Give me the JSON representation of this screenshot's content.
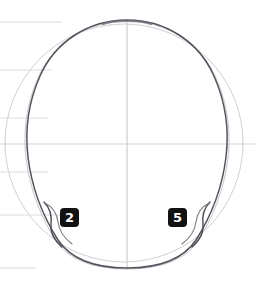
{
  "figure": {
    "background_color": "#ffffff",
    "width": 255,
    "height": 284
  },
  "ink": {
    "contour_color": "#3c3c42",
    "construction_color": "#c9c9cf",
    "guide_color": "#d8d8de",
    "badge_background": "#121212",
    "badge_text_color": "#ffffff"
  },
  "annotations": {
    "badges": [
      {
        "id": "badge-2",
        "label": "2",
        "side": "left",
        "x": 60,
        "y": 208
      },
      {
        "id": "badge-5",
        "label": "5",
        "side": "right",
        "x": 168,
        "y": 208
      }
    ]
  },
  "construction": {
    "circle": {
      "cx": 124,
      "cy": 143,
      "r": 119
    },
    "vertical_axis": {
      "x": 127,
      "y_top": 20,
      "y_bottom": 270
    },
    "horizontal_axis": {
      "y": 144,
      "x_left": 0,
      "x_right": 255
    },
    "guide_lines": [
      {
        "id": "guide-1",
        "y": 22,
        "x_left": 0,
        "x_right": 62
      },
      {
        "id": "guide-2",
        "y": 70,
        "x_left": 0,
        "x_right": 52
      },
      {
        "id": "guide-3",
        "y": 118,
        "x_left": 0,
        "x_right": 48
      },
      {
        "id": "guide-4",
        "y": 172,
        "x_left": 0,
        "x_right": 48
      },
      {
        "id": "guide-5",
        "y": 215,
        "x_left": 0,
        "x_right": 60
      },
      {
        "id": "guide-6",
        "y": 268,
        "x_left": 0,
        "x_right": 36
      }
    ]
  },
  "paths": {
    "cranium_outline": "M 127 20 C 166 20 199 42 214 76 C 226 103 229 132 226 157 C 222 190 210 218 196 240 C 186 255 166 268 127 268 C 88 268 68 255 58 240 C 44 218 32 190 28 157 C 25 132 28 103 40 76 C 55 42 88 20 127 20 Z",
    "left_jaw_hook": "M 44 202 C 50 208 52 216 51 224 C 50 232 54 240 62 247",
    "left_jaw_inner": "M 45 203 C 53 207 57 214 58 222 C 59 230 64 238 72 244",
    "right_jaw_hook": "M 210 202 C 204 208 202 216 203 224 C 204 232 200 240 192 247",
    "right_jaw_inner": "M 209 203 C 201 207 197 214 196 222 C 195 230 190 238 182 244"
  }
}
